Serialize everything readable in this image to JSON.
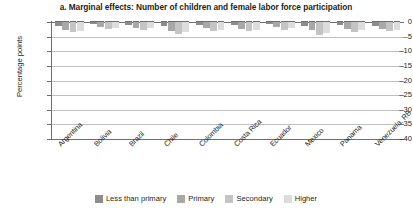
{
  "chart_data": {
    "type": "bar",
    "title": "a. Marginal effects: Number of children and female labor force participation",
    "xlabel": "",
    "ylabel": "Percentage points",
    "ylim": [
      -40,
      0
    ],
    "yticks": [
      0,
      -5,
      -10,
      -15,
      -20,
      -25,
      -30,
      -35,
      -40
    ],
    "ytick_labels": [
      "0",
      "–5",
      "–10",
      "–15",
      "–20",
      "–25",
      "–30",
      "–35",
      "–40"
    ],
    "grid": true,
    "legend_position": "bottom",
    "categories": [
      "Argentina",
      "Bolivia",
      "Brazil",
      "Chile",
      "Colombia",
      "Costa Rica",
      "Ecuador",
      "Mexico",
      "Panama",
      "Venezuela, RB"
    ],
    "series": [
      {
        "name": "Less than primary",
        "color": "#8c8c8c",
        "values": [
          -1.2,
          -0.8,
          -1.0,
          -1.5,
          -0.9,
          -1.1,
          -0.8,
          -1.4,
          -1.0,
          -1.2
        ]
      },
      {
        "name": "Primary",
        "color": "#a8a8a8",
        "values": [
          -2.6,
          -1.6,
          -2.0,
          -3.0,
          -2.2,
          -2.3,
          -1.8,
          -2.8,
          -2.4,
          -2.5
        ]
      },
      {
        "name": "Secondary",
        "color": "#c4c4c4",
        "values": [
          -3.4,
          -2.4,
          -2.6,
          -4.0,
          -3.0,
          -3.2,
          -2.6,
          -4.6,
          -3.4,
          -3.2
        ]
      },
      {
        "name": "Higher",
        "color": "#dcdcdc",
        "values": [
          -3.0,
          -2.0,
          -2.2,
          -3.4,
          -2.6,
          -2.7,
          -2.2,
          -3.6,
          -2.9,
          -2.8
        ]
      }
    ]
  }
}
